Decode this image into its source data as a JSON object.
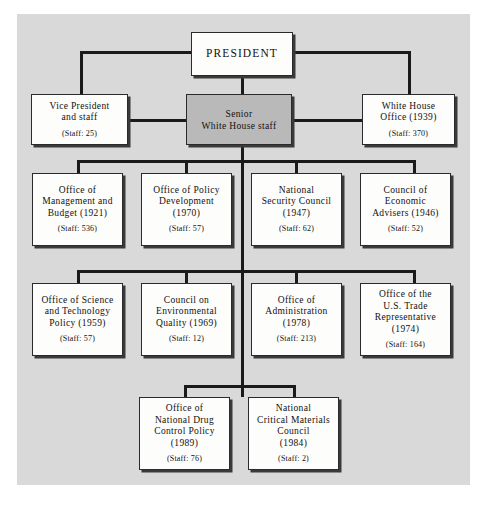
{
  "figure": {
    "type": "org-chart",
    "canvas_color": "#d9d9d9",
    "box_color": "#fdfdfb",
    "shaded_box_color": "#b9b9b9",
    "line_color": "#1a1a1a"
  },
  "nodes": {
    "president": {
      "title": "PRESIDENT",
      "staff": ""
    },
    "vice_president": {
      "title": "Vice President\nand staff",
      "staff": "(Staff: 25)"
    },
    "senior_staff": {
      "title": "Senior\nWhite House staff",
      "staff": ""
    },
    "white_house_office": {
      "title": "White House\nOffice (1939)",
      "staff": "(Staff: 370)"
    }
  },
  "row2": [
    {
      "title": "Office of\nManagement and\nBudget (1921)",
      "staff": "(Staff: 536)"
    },
    {
      "title": "Office of Policy\nDevelopment\n(1970)",
      "staff": "(Staff: 57)"
    },
    {
      "title": "National\nSecurity Council\n(1947)",
      "staff": "(Staff: 62)"
    },
    {
      "title": "Council of\nEconomic\nAdvisers (1946)",
      "staff": "(Staff: 52)"
    }
  ],
  "row3": [
    {
      "title": "Office of Science\nand Technology\nPolicy (1959)",
      "staff": "(Staff: 57)"
    },
    {
      "title": "Council on\nEnvironmental\nQuality (1969)",
      "staff": "(Staff: 12)"
    },
    {
      "title": "Office of\nAdministration\n(1978)",
      "staff": "(Staff: 213)"
    },
    {
      "title": "Office of the\nU.S. Trade\nRepresentative\n(1974)",
      "staff": "(Staff: 164)"
    }
  ],
  "row4": [
    {
      "title": "Office of\nNational Drug\nControl Policy\n(1989)",
      "staff": "(Staff: 76)"
    },
    {
      "title": "National\nCritical Materials\nCouncil\n(1984)",
      "staff": "(Staff: 2)"
    }
  ]
}
